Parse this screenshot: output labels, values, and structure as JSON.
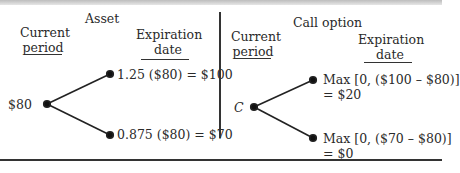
{
  "asset_panel": {
    "title": "Asset",
    "current_period": [
      "Current",
      "period"
    ],
    "expiration_date": [
      "Expiration",
      "date"
    ],
    "start_value": "$80",
    "up_outcome": "1.25 ($80) = $100",
    "down_outcome": "0.875 ($80) = $70"
  },
  "option_panel": {
    "title": "Call option",
    "current_period": [
      "Current",
      "period"
    ],
    "expiration_date": [
      "Expiration",
      "date"
    ],
    "start_value": "C",
    "up_outcome": [
      "Max [0, ($100 – $80)]",
      "= $20"
    ],
    "down_outcome": [
      "Max [0, ($70 – $80)]",
      "= $0"
    ]
  },
  "colors": {
    "ink": "#2a2a2a",
    "background": "#ffffff"
  }
}
